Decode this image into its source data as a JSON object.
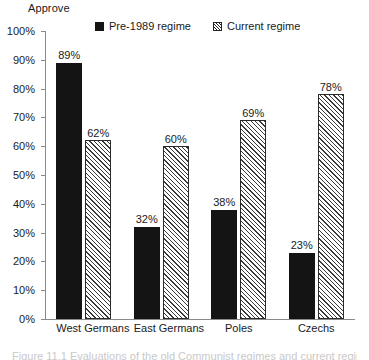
{
  "chart_data": {
    "type": "bar",
    "title": "",
    "ylabel": "Approve",
    "xlabel": "",
    "categories": [
      "West Germans",
      "East Germans",
      "Poles",
      "Czechs"
    ],
    "series": [
      {
        "name": "Pre-1989 regime",
        "style": "solid-black",
        "values": [
          89,
          62,
          32,
          38
        ],
        "value_labels": [
          "89%",
          "32%",
          "38%",
          "23%"
        ]
      },
      {
        "name": "Current regime",
        "style": "hatched",
        "values": [
          62,
          60,
          69,
          78
        ],
        "value_labels": [
          "62%",
          "60%",
          "69%",
          "78%"
        ]
      }
    ],
    "bars": [
      {
        "category": "West Germans",
        "series": "Pre-1989 regime",
        "value": 89,
        "label": "89%"
      },
      {
        "category": "West Germans",
        "series": "Current regime",
        "value": 62,
        "label": "62%"
      },
      {
        "category": "East Germans",
        "series": "Pre-1989 regime",
        "value": 32,
        "label": "32%"
      },
      {
        "category": "East Germans",
        "series": "Current regime",
        "value": 60,
        "label": "60%"
      },
      {
        "category": "Poles",
        "series": "Pre-1989 regime",
        "value": 38,
        "label": "38%"
      },
      {
        "category": "Poles",
        "series": "Current regime",
        "value": 69,
        "label": "69%"
      },
      {
        "category": "Czechs",
        "series": "Pre-1989 regime",
        "value": 23,
        "label": "23%"
      },
      {
        "category": "Czechs",
        "series": "Current regime",
        "value": 78,
        "label": "78%"
      }
    ],
    "ylim": [
      0,
      100
    ],
    "ytick_values": [
      100,
      90,
      80,
      70,
      60,
      50,
      40,
      30,
      20,
      10,
      0
    ],
    "ytick_labels": [
      "100%",
      "90%",
      "80%",
      "70%",
      "60%",
      "50%",
      "40%",
      "30%",
      "20%",
      "10%",
      "0%"
    ],
    "grid": false,
    "legend_position": "top-center",
    "colors": {
      "series1": "#141414",
      "series2_line": "#3a3a3a",
      "series2_fill": "#ffffff",
      "axis": "#8a8a8a",
      "text": "#1a1a1a",
      "background": "#ffffff"
    }
  },
  "legend": {
    "entries": [
      {
        "label": "Pre-1989 regime",
        "swatch": "solid-black-square"
      },
      {
        "label": "Current regime",
        "swatch": "hatched-square"
      }
    ]
  },
  "caption": {
    "text": "Figure 11.1  Evaluations of the old Communist regimes and current regimes"
  }
}
